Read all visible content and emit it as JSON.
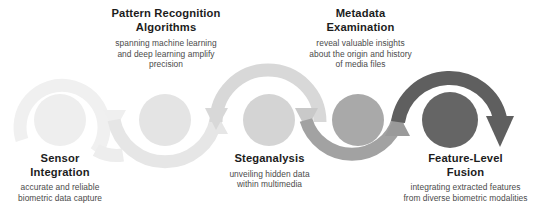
{
  "diagram": {
    "type": "process-wave",
    "title": "",
    "orientation": "horizontal",
    "direction": "left-to-right",
    "background_color": "#ffffff",
    "step_count": 5,
    "palette": {
      "step_1": "#efefef",
      "step_2": "#e2e2e2",
      "step_3": "#d2d2d2",
      "step_4": "#a8a8a8",
      "step_5": "#666666",
      "title_color": "#1c1c1c",
      "description_color": "#4a4a4a"
    },
    "steps": [
      {
        "index": 1,
        "title": "Sensor\nIntegration",
        "description": "accurate and reliable\nbiometric data capture",
        "label_position": "below",
        "node_color": "#eeeeee",
        "arc_color": "#f0f0f0",
        "circle_cx": 60,
        "circle_cy": 120,
        "circle_r": 26
      },
      {
        "index": 2,
        "title": "Pattern Recognition\nAlgorithms",
        "description": "spanning machine learning\nand deep learning amplify\nprecision",
        "label_position": "above",
        "node_color": "#e6e6e6",
        "arc_color": "#e6e6e6",
        "circle_cx": 165,
        "circle_cy": 120,
        "circle_r": 26
      },
      {
        "index": 3,
        "title": "Steganalysis",
        "description": "unveiling hidden data\nwithin multimedia",
        "label_position": "below",
        "node_color": "#d6d6d6",
        "arc_color": "#d8d8d8",
        "circle_cx": 269,
        "circle_cy": 120,
        "circle_r": 26
      },
      {
        "index": 4,
        "title": "Metadata\nExamination",
        "description": "reveal valuable insights\nabout the origin and history\nof media files",
        "label_position": "above",
        "node_color": "#a9a9a9",
        "arc_color": "#a2a2a2",
        "circle_cx": 358,
        "circle_cy": 120,
        "circle_r": 26
      },
      {
        "index": 5,
        "title": "Feature-Level\nFusion",
        "description": "integrating extracted features\nfrom diverse biometric modalities",
        "label_position": "below",
        "node_color": "#656565",
        "arc_color": "#5f5f5f",
        "circle_cx": 450,
        "circle_cy": 120,
        "circle_r": 28
      }
    ],
    "connectors": [
      {
        "from": 1,
        "to": 2,
        "shape": "arc-down",
        "arrowhead": "down",
        "arrow_x": 114,
        "arrow_y": 122
      },
      {
        "from": 2,
        "to": 3,
        "shape": "arc-up",
        "arrowhead": "up",
        "arrow_x": 216,
        "arrow_y": 120
      },
      {
        "from": 3,
        "to": 4,
        "shape": "arc-down",
        "arrowhead": "down",
        "arrow_x": 306,
        "arrow_y": 122
      },
      {
        "from": 4,
        "to": 5,
        "shape": "arc-up",
        "arrowhead": "up",
        "arrow_x": 397,
        "arrow_y": 120
      },
      {
        "from": 5,
        "to": null,
        "shape": "arc-end",
        "arrowhead": "down",
        "arrow_x": 500,
        "arrow_y": 145
      }
    ]
  }
}
